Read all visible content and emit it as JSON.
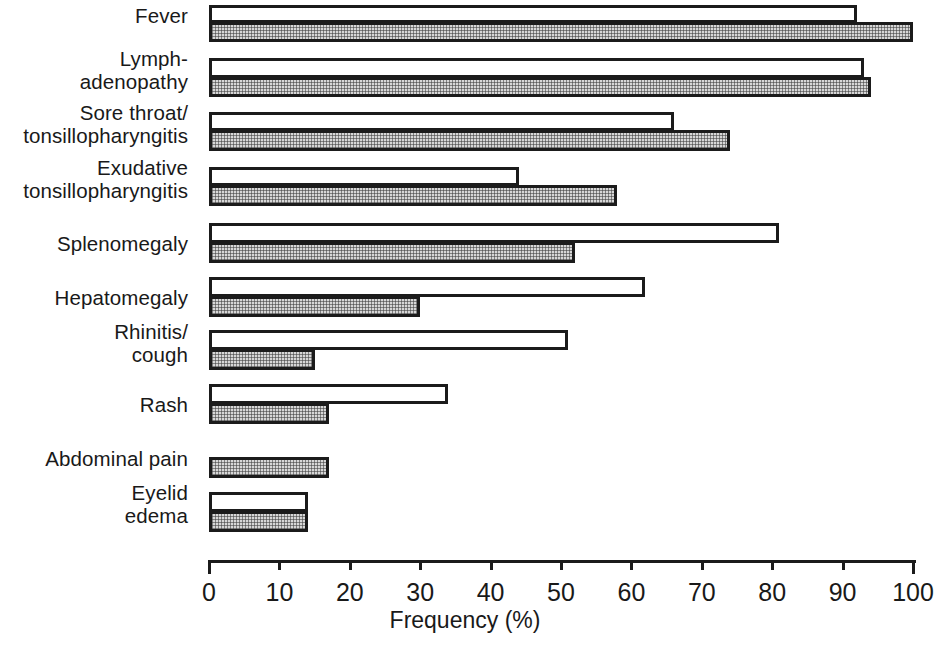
{
  "chart_data": {
    "type": "bar",
    "orientation": "horizontal",
    "title": "",
    "xlabel": "Frequency (%)",
    "ylabel": "",
    "xlim": [
      0,
      100
    ],
    "xticks": [
      0,
      10,
      20,
      30,
      40,
      50,
      60,
      70,
      80,
      90,
      100
    ],
    "xtick_labels": [
      "0",
      "10",
      "20",
      "30",
      "40",
      "50",
      "60",
      "70",
      "80",
      "90",
      "100"
    ],
    "grid": false,
    "legend": null,
    "categories": [
      "Fever",
      "Lymph-\nadenopathy",
      "Sore throat/\ntonsillopharyngitis",
      "Exudative\ntonsillopharyngitis",
      "Splenomegaly",
      "Hepatomegaly",
      "Rhinitis/\ncough",
      "Rash",
      "Abdominal pain",
      "Eyelid\nedema"
    ],
    "series": [
      {
        "name": "open",
        "style": "white-outlined",
        "values": [
          92,
          93,
          66,
          44,
          81,
          62,
          51,
          34,
          null,
          14
        ]
      },
      {
        "name": "shaded",
        "style": "stippled-gray",
        "values": [
          100,
          94,
          74,
          58,
          52,
          30,
          15,
          17,
          17,
          14
        ]
      }
    ]
  },
  "axis": {
    "title": "Frequency (%)"
  },
  "colors": {
    "bar_outline": "#1b1b1b",
    "bar_open_fill": "#ffffff",
    "bar_shaded_fill": "#d7d7d7",
    "text": "#191919",
    "background": "#ffffff"
  }
}
